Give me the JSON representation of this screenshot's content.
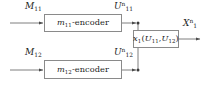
{
  "diagram": {
    "background_color": "#ffffff",
    "line_color": "#6f6f6f",
    "text_color": "#1b1b1b",
    "blocks": [
      {
        "id": "encoder-top",
        "label_base": "m",
        "label_sub": "11",
        "label_suffix": "-encoder"
      },
      {
        "id": "encoder-bottom",
        "label_base": "m",
        "label_sub": "12",
        "label_suffix": "-encoder"
      },
      {
        "id": "function",
        "label_base": "x",
        "label_sub": "1",
        "arg_open": "(",
        "arg1_base": "U",
        "arg1_sub": "11",
        "arg_sep": ",",
        "arg2_base": "U",
        "arg2_sub": "12",
        "arg_close": ")"
      }
    ],
    "signals": [
      {
        "id": "m11",
        "base": "M",
        "sub": "11",
        "sup": ""
      },
      {
        "id": "m12",
        "base": "M",
        "sub": "12",
        "sup": ""
      },
      {
        "id": "u11",
        "base": "U",
        "sub": "11",
        "sup": "n"
      },
      {
        "id": "u12",
        "base": "U",
        "sub": "12",
        "sup": "n"
      },
      {
        "id": "x1",
        "base": "X",
        "sub": "1",
        "sup": "n"
      }
    ]
  }
}
